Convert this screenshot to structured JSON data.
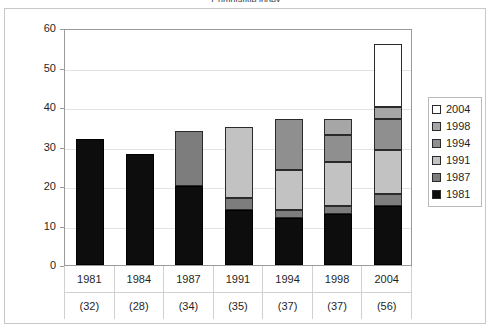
{
  "chart_data": {
    "type": "bar",
    "title": "Cumulative index",
    "subtype": "stacked",
    "xlabel": "",
    "ylabel": "",
    "ylim": [
      0,
      60
    ],
    "yticks": [
      0,
      10,
      20,
      30,
      40,
      50,
      60
    ],
    "grid": true,
    "legend_position": "right",
    "categories": [
      "1981",
      "1984",
      "1987",
      "1991",
      "1994",
      "1998",
      "2004"
    ],
    "category_counts": [
      "(32)",
      "(28)",
      "(34)",
      "(35)",
      "(37)",
      "(37)",
      "(56)"
    ],
    "totals": [
      32,
      28,
      34,
      35,
      37,
      37,
      56
    ],
    "series": [
      {
        "name": "1981",
        "color": "#0d0d0d",
        "values": [
          32,
          28,
          20,
          14,
          12,
          13,
          15
        ]
      },
      {
        "name": "1987",
        "color": "#7d7d7d",
        "values": [
          0,
          0,
          14,
          3,
          2,
          2,
          3
        ]
      },
      {
        "name": "1991",
        "color": "#c2c2c2",
        "values": [
          0,
          0,
          0,
          18,
          10,
          11,
          11
        ]
      },
      {
        "name": "1994",
        "color": "#8f8f8f",
        "values": [
          0,
          0,
          0,
          0,
          13,
          7,
          8
        ]
      },
      {
        "name": "1998",
        "color": "#a6a6a6",
        "values": [
          0,
          0,
          0,
          0,
          0,
          4,
          3
        ]
      },
      {
        "name": "2004",
        "color": "#ffffff",
        "values": [
          0,
          0,
          0,
          0,
          0,
          0,
          16
        ]
      }
    ],
    "legend_entries": [
      {
        "label": "2004",
        "color": "#ffffff"
      },
      {
        "label": "1998",
        "color": "#a6a6a6"
      },
      {
        "label": "1994",
        "color": "#8f8f8f"
      },
      {
        "label": "1991",
        "color": "#c2c2c2"
      },
      {
        "label": "1987",
        "color": "#7d7d7d"
      },
      {
        "label": "1981",
        "color": "#0d0d0d"
      }
    ]
  }
}
